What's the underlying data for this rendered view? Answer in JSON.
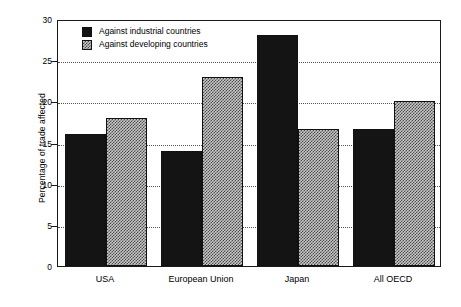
{
  "chart_data": {
    "type": "bar",
    "title": "",
    "subtitle": "",
    "xlabel": "",
    "ylabel": "Percentage of trade affected",
    "categories": [
      "USA",
      "European Union",
      "Japan",
      "All OECD"
    ],
    "series": [
      {
        "name": "Against industrial countries",
        "values": [
          16.0,
          14.0,
          28.0,
          16.6
        ],
        "style": "solid-black",
        "color": "#141414"
      },
      {
        "name": "Against developing countries",
        "values": [
          18.0,
          23.0,
          16.6,
          20.1
        ],
        "style": "checkered-hatch",
        "color": "#c9c9c9"
      }
    ],
    "ylim": [
      0,
      30
    ],
    "yticks": [
      0,
      5,
      10,
      15,
      20,
      25,
      30
    ],
    "ytick_labels": [
      "0",
      "5",
      "10",
      "15",
      "20",
      "25",
      "30"
    ],
    "grid": true,
    "grid_axis": "y",
    "grid_style": "dotted",
    "legend_position": "top-left-inside",
    "legend_entries": [
      "Against industrial countries",
      "Against developing countries"
    ],
    "frame": true,
    "background_color": "#ffffff",
    "axis_color": "#1a1a1a"
  }
}
